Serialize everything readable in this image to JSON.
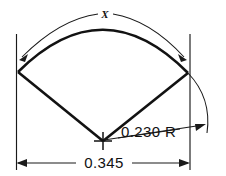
{
  "drawing": {
    "title": "Circular sector part detail drawing",
    "background_color": "#ffffff",
    "line_color": "#121212",
    "dimensions": {
      "arc_length": {
        "label": "X",
        "name": "arc-length-dimension",
        "type": "arc",
        "position": "top"
      },
      "radius": {
        "label": "0.230 R",
        "value": "0.230",
        "suffix": "R",
        "name": "radius-dimension",
        "type": "radial",
        "position": "right"
      },
      "width": {
        "label": "0.345",
        "value": "0.345",
        "name": "overall-width-dimension",
        "type": "linear",
        "position": "bottom"
      }
    },
    "geometry": {
      "apex": {
        "x": 103,
        "y": 141
      },
      "left_vertex": {
        "x": 18,
        "y": 72
      },
      "right_vertex": {
        "x": 188,
        "y": 73
      },
      "arc_peak": {
        "y": 24
      }
    }
  }
}
